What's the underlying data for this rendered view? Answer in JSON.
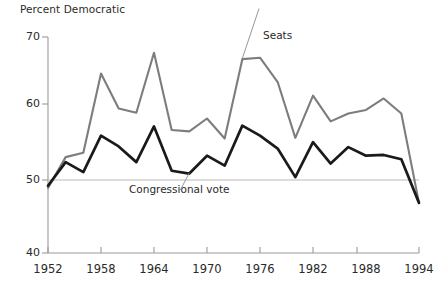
{
  "chart_data": {
    "type": "line",
    "title": "",
    "ylabel": "Percent Democratic",
    "xlabel": "",
    "ylim": [
      40,
      70
    ],
    "xlim": [
      1952,
      1994
    ],
    "yticks": [
      40,
      50,
      60,
      70
    ],
    "ytick_labels": [
      "40",
      "50",
      "60",
      "70"
    ],
    "xticks": [
      1952,
      1958,
      1964,
      1970,
      1976,
      1982,
      1988,
      1994
    ],
    "xtick_labels": [
      "1952",
      "1958",
      "1964",
      "1970",
      "1976",
      "1982",
      "1988",
      "1994"
    ],
    "grid": "reference line at 50 only",
    "legend_position": "inline annotations on curves",
    "x": [
      1952,
      1954,
      1956,
      1958,
      1960,
      1962,
      1964,
      1966,
      1968,
      1970,
      1972,
      1974,
      1976,
      1978,
      1980,
      1982,
      1984,
      1986,
      1988,
      1990,
      1992,
      1994
    ],
    "series": [
      {
        "name": "Seats",
        "color": "#7d7d7d",
        "values": [
          48.9,
          53.2,
          53.8,
          64.9,
          60.0,
          59.4,
          67.8,
          57.0,
          56.8,
          58.6,
          55.8,
          66.9,
          67.1,
          63.7,
          55.9,
          61.8,
          58.2,
          59.3,
          59.8,
          61.4,
          59.3,
          46.8
        ]
      },
      {
        "name": "Congressional vote",
        "color": "#1a1a1a",
        "values": [
          49.2,
          52.5,
          51.1,
          56.2,
          54.7,
          52.5,
          57.5,
          51.3,
          50.9,
          53.4,
          52.0,
          57.6,
          56.2,
          54.4,
          50.4,
          55.3,
          52.3,
          54.6,
          53.4,
          53.5,
          52.9,
          46.8
        ]
      }
    ],
    "annotations": [
      {
        "text": "Seats",
        "x": 1976,
        "y": 70.2,
        "leader_to": [
          1974,
          67.0
        ]
      },
      {
        "text": "Congressional vote",
        "x": 1964,
        "y": 49.0,
        "leader_to": [
          1968,
          51.0
        ]
      }
    ]
  },
  "labels": {
    "axis_title": "Percent Democratic",
    "seats": "Seats",
    "congressional_vote": "Congressional vote"
  }
}
